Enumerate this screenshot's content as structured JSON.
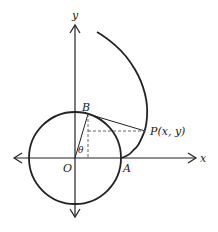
{
  "diagram": {
    "labels": {
      "y_axis": "y",
      "x_axis": "x",
      "origin": "O",
      "point_a": "A",
      "point_b": "B",
      "point_p": "P(x, y)",
      "angle": "θ"
    },
    "colors": {
      "stroke": "#222222",
      "dashed": "#555555",
      "background": "#ffffff"
    },
    "geometry": {
      "origin_px": [
        75,
        158
      ],
      "radius_px": 46,
      "theta_deg_from_x_axis": 74
    }
  }
}
